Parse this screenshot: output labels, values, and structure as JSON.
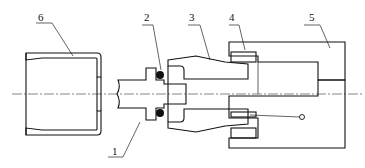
{
  "figure": {
    "type": "mechanical-assembly-cross-section",
    "colors": {
      "line": "#111111",
      "background": "#ffffff"
    }
  },
  "callouts": [
    {
      "id": "1",
      "label": "1",
      "part": "shaft"
    },
    {
      "id": "2",
      "label": "2",
      "part": "o-ring"
    },
    {
      "id": "3",
      "label": "3",
      "part": "sleeve"
    },
    {
      "id": "4",
      "label": "4",
      "part": "seal-ring"
    },
    {
      "id": "5",
      "label": "5",
      "part": "housing"
    },
    {
      "id": "6",
      "label": "6",
      "part": "cap"
    }
  ]
}
